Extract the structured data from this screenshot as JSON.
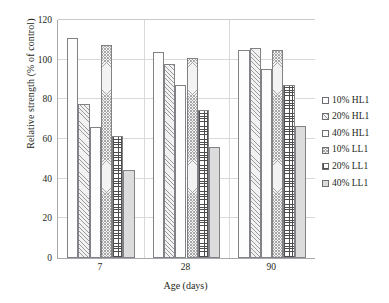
{
  "chart_data": {
    "type": "bar",
    "title": "",
    "subtitle": "",
    "xlabel": "Age (days)",
    "ylabel": "Relative strength (% of control)",
    "categories": [
      "7",
      "28",
      "90"
    ],
    "ylim": [
      0,
      120
    ],
    "yticks": [
      0,
      20,
      40,
      60,
      80,
      100,
      120
    ],
    "grid": true,
    "legend_position": "right",
    "series": [
      {
        "name": "10% HL1",
        "pattern": "plain-white",
        "values": [
          111.0,
          104.0,
          105.0
        ]
      },
      {
        "name": "20% HL1",
        "pattern": "diagonal-hatch",
        "values": [
          77.5,
          98.0,
          106.0
        ]
      },
      {
        "name": "40% HL1",
        "pattern": "plain-white",
        "values": [
          66.0,
          87.0,
          95.5
        ]
      },
      {
        "name": "10% LL1",
        "pattern": "fine-cross-hatch",
        "values": [
          107.5,
          101.0,
          105.0
        ]
      },
      {
        "name": "20% LL1",
        "pattern": "grid-checker",
        "values": [
          61.5,
          74.5,
          87.0
        ]
      },
      {
        "name": "40% LL1",
        "pattern": "solid-light-gray",
        "values": [
          44.5,
          56.0,
          66.5
        ]
      }
    ]
  },
  "legend": {
    "items": [
      {
        "label": "10% HL1"
      },
      {
        "label": "20% HL1"
      },
      {
        "label": "40% HL1"
      },
      {
        "label": "10% LL1"
      },
      {
        "label": "20% LL1"
      },
      {
        "label": "40% LL1"
      }
    ]
  }
}
